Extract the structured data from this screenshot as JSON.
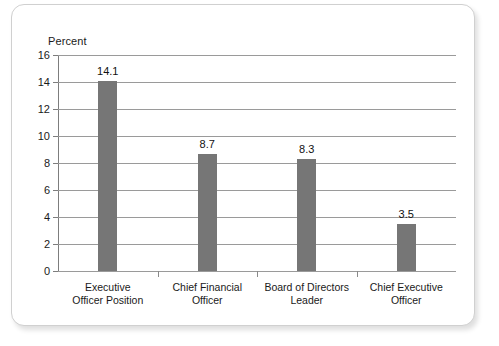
{
  "chart_data": {
    "type": "bar",
    "title": "",
    "subtitle": "",
    "xlabel": "",
    "ylabel": "Percent",
    "ylim": [
      0,
      16
    ],
    "ytick_step": 2,
    "yticks": [
      "16",
      "14",
      "12",
      "10",
      "8",
      "6",
      "4",
      "2",
      "0"
    ],
    "grid": true,
    "legend": false,
    "categories": [
      "Executive\nOfficer Position",
      "Chief Financial\nOfficer",
      "Board of Directors\nLeader",
      "Chief Executive\nOfficer"
    ],
    "category_lines": [
      [
        "Executive",
        "Officer Position"
      ],
      [
        "Chief Financial",
        "Officer"
      ],
      [
        "Board of Directors",
        "Leader"
      ],
      [
        "Chief Executive",
        "Officer"
      ]
    ],
    "values": [
      14.1,
      8.7,
      8.3,
      3.5
    ],
    "value_labels": [
      "14.1",
      "8.7",
      "8.3",
      "3.5"
    ],
    "bar_color": "#767676",
    "gridline_color": "#9a9a9a",
    "axis_color": "#7d7d7d",
    "text_color": "#1a1a1a",
    "background_color": "#ffffff",
    "panel_border_color": "#d0d0d0"
  }
}
